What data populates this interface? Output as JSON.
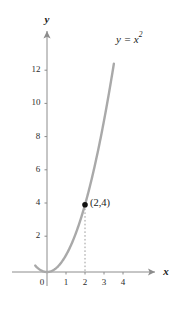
{
  "chart_data": {
    "type": "line",
    "title": "",
    "function_label": "y = x²",
    "xlabel": "x",
    "ylabel": "y",
    "xlim": [
      -0.8,
      4.9
    ],
    "ylim": [
      -0.9,
      13.6
    ],
    "xticks": [
      0,
      1,
      2,
      3,
      4
    ],
    "xtick_labels": [
      "0",
      "1",
      "2",
      "3",
      "4"
    ],
    "yticks": [
      2,
      4,
      6,
      8,
      10,
      12
    ],
    "ytick_labels": [
      "2",
      "4",
      "6",
      "8",
      "10",
      "12"
    ],
    "grid": false,
    "series": [
      {
        "name": "y = x²",
        "equation": "y = x^2",
        "x_start": -0.62,
        "x_end": 3.52,
        "color": "#a9a9a9"
      }
    ],
    "annotations": [
      {
        "name": "point-2-4",
        "label": "(2,4)",
        "x": 2,
        "y": 4,
        "marker": "filled-circle",
        "marker_color": "#111111",
        "dropline": true,
        "dropline_style": "dotted",
        "dropline_color": "#9a9a9a"
      }
    ],
    "axis_color": "#8c8c8c",
    "axis_arrows": [
      "x-positive",
      "y-positive"
    ],
    "background": "#ffffff"
  },
  "labels": {
    "curve": "y = x²",
    "curve_base": "y = x",
    "curve_exponent": "2",
    "point": "(2,4)",
    "x_axis": "x",
    "y_axis": "y"
  }
}
